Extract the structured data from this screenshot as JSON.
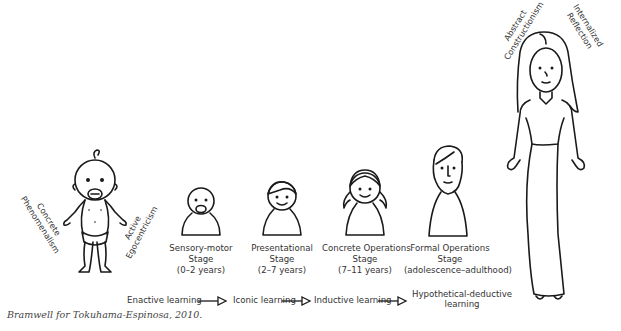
{
  "stages": [
    {
      "id": "infant",
      "label_lines": [],
      "side_labels": {
        "left": [
          "Concrete",
          "Phenomenalism"
        ],
        "right": [
          "Active",
          "Egocentricism"
        ]
      }
    },
    {
      "id": "sensory-motor",
      "label_lines": [
        "Sensory-motor",
        "Stage",
        "(0–2 years)"
      ]
    },
    {
      "id": "presentational",
      "label_lines": [
        "Presentational",
        "Stage",
        "(2–7 years)"
      ]
    },
    {
      "id": "concrete-operations",
      "label_lines": [
        "Concrete Operations",
        "Stage",
        "(7–11 years)"
      ]
    },
    {
      "id": "formal-operations",
      "label_lines": [
        "Formal Operations",
        "Stage",
        "(adolescence–adulthood)"
      ]
    },
    {
      "id": "adult",
      "label_lines": [],
      "side_labels": {
        "left": [
          "Abstract",
          "Constructionism"
        ],
        "right": [
          "Internalized",
          "Reflection"
        ]
      }
    }
  ],
  "learning_flow": {
    "steps": [
      {
        "label_lines": [
          "Enactive learning"
        ]
      },
      {
        "label_lines": [
          "Iconic learning"
        ]
      },
      {
        "label_lines": [
          "Inductive learning"
        ]
      },
      {
        "label_lines": [
          "Hypothetical-deductive",
          "learning"
        ]
      }
    ],
    "arrow_icon": "open-triangle-arrow"
  },
  "credit": "Bramwell for Tokuhama-Espinosa, 2010."
}
